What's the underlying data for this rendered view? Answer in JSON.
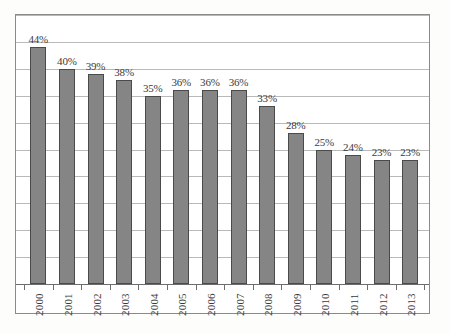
{
  "chart_data": {
    "type": "bar",
    "title": "",
    "subtitle": "",
    "xlabel": "",
    "ylabel": "",
    "categories": [
      "2000",
      "2001",
      "2002",
      "2003",
      "2004",
      "2005",
      "2006",
      "2007",
      "2008",
      "2009",
      "2010",
      "2011",
      "2012",
      "2013"
    ],
    "values": [
      44,
      40,
      39,
      38,
      35,
      36,
      36,
      36,
      33,
      28,
      25,
      24,
      23,
      23
    ],
    "data_labels": [
      "44%",
      "40%",
      "39%",
      "38%",
      "35%",
      "36%",
      "36%",
      "36%",
      "33%",
      "28%",
      "25%",
      "24%",
      "23%",
      "23%"
    ],
    "ylim": [
      0,
      50
    ],
    "y_tick_step": 5,
    "y_tick_values": [
      0,
      5,
      10,
      15,
      20,
      25,
      30,
      35,
      40,
      45,
      50
    ],
    "y_tick_labels_visible": false,
    "grid": true,
    "grid_orientation": "horizontal",
    "legend": false,
    "legend_position": "none",
    "series": [
      {
        "name": "Percentage",
        "values": [
          44,
          40,
          39,
          38,
          35,
          36,
          36,
          36,
          33,
          28,
          25,
          24,
          23,
          23
        ]
      }
    ],
    "bar_color": "#858585",
    "bar_border_color": "#4a4a4a",
    "gridline_color": "#b9b9b9",
    "axis_color": "#6d6d6d",
    "frame_color": "#8a8a8a",
    "label_color": "#3a3a3a",
    "background_color": "#ffffff"
  },
  "scan": {
    "bottom_artifact": ""
  }
}
